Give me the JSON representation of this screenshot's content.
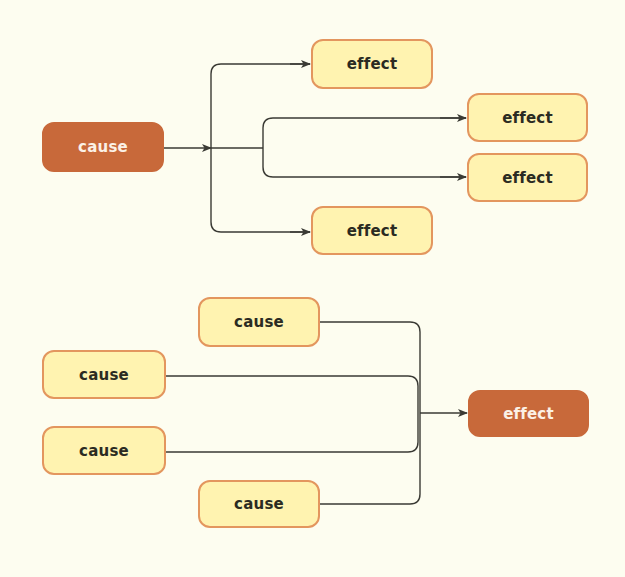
{
  "colors": {
    "background": "#fdfdf0",
    "light_fill": "#fff3b0",
    "light_border": "#e3965e",
    "dark_fill": "#c8693a",
    "line": "#3a3a34"
  },
  "diagrams": [
    {
      "name": "one-cause-many-effects",
      "nodes": [
        {
          "id": "top-cause",
          "label": "cause",
          "style": "dark",
          "x": 42,
          "y": 122,
          "w": 122,
          "h": 50
        },
        {
          "id": "effect-1",
          "label": "effect",
          "style": "light",
          "x": 311,
          "y": 39,
          "w": 122,
          "h": 50
        },
        {
          "id": "effect-2",
          "label": "effect",
          "style": "light",
          "x": 467,
          "y": 93,
          "w": 121,
          "h": 49
        },
        {
          "id": "effect-3",
          "label": "effect",
          "style": "light",
          "x": 467,
          "y": 153,
          "w": 121,
          "h": 49
        },
        {
          "id": "effect-4",
          "label": "effect",
          "style": "light",
          "x": 311,
          "y": 206,
          "w": 122,
          "h": 49
        }
      ]
    },
    {
      "name": "many-causes-one-effect",
      "nodes": [
        {
          "id": "cause-1",
          "label": "cause",
          "style": "light",
          "x": 198,
          "y": 297,
          "w": 122,
          "h": 50
        },
        {
          "id": "cause-2",
          "label": "cause",
          "style": "light",
          "x": 42,
          "y": 350,
          "w": 124,
          "h": 49
        },
        {
          "id": "cause-3",
          "label": "cause",
          "style": "light",
          "x": 42,
          "y": 426,
          "w": 124,
          "h": 49
        },
        {
          "id": "cause-4",
          "label": "cause",
          "style": "light",
          "x": 198,
          "y": 480,
          "w": 122,
          "h": 48
        },
        {
          "id": "bottom-effect",
          "label": "effect",
          "style": "dark",
          "x": 468,
          "y": 390,
          "w": 121,
          "h": 47
        }
      ]
    }
  ]
}
